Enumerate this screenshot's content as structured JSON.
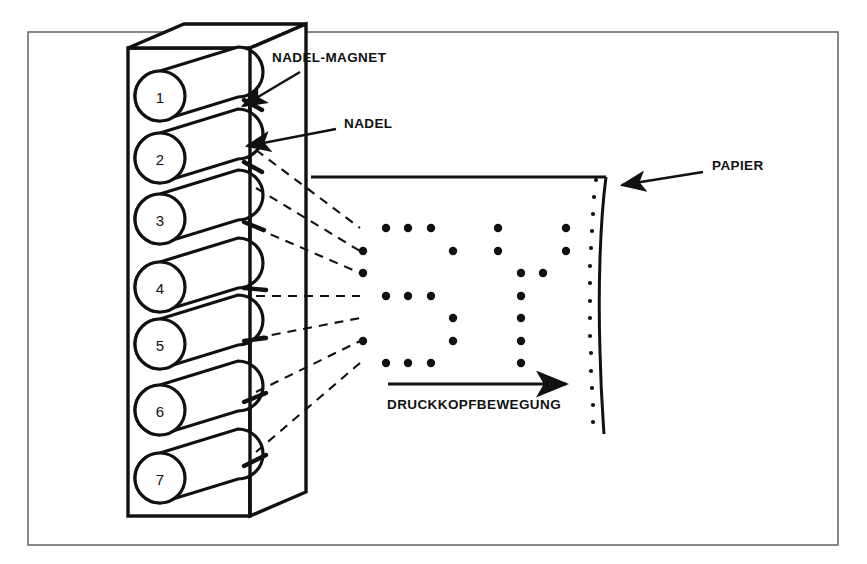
{
  "figure": {
    "background_color": "#ffffff",
    "ink_color": "#111111",
    "frame": {
      "x": 28,
      "y": 32,
      "width": 810,
      "height": 513,
      "stroke_width": 1.6
    }
  },
  "labels": {
    "needle_magnet": "NADEL-MAGNET",
    "needle": "NADEL",
    "paper": "PAPIER",
    "head_movement": "DRUCKKOPFBEWEGUNG"
  },
  "print_head": {
    "needle_count": 7,
    "needle_numbers": [
      "1",
      "2",
      "3",
      "4",
      "5",
      "6",
      "7"
    ],
    "housing": {
      "front_x": 128,
      "front_y": 48,
      "front_w": 122,
      "front_h": 468,
      "depth_x": 56,
      "depth_y": -24
    },
    "needles": [
      {
        "number": "1",
        "cy": 96
      },
      {
        "number": "2",
        "cy": 158
      },
      {
        "number": "3",
        "cy": 219
      },
      {
        "number": "4",
        "cy": 287
      },
      {
        "number": "5",
        "cy": 344
      },
      {
        "number": "6",
        "cy": 410
      },
      {
        "number": "7",
        "cy": 478
      }
    ],
    "coil_radius": 25
  },
  "paper": {
    "top_edge": {
      "x1": 311,
      "y1": 177,
      "x2": 605,
      "y2": 177
    },
    "curved_edge_top": {
      "x": 606,
      "y": 177
    },
    "curved_edge_bottom": {
      "x": 604,
      "y": 434
    },
    "sprocket_dot_count": 15,
    "sprocket_dot_radius": 2.1
  },
  "movement_arrow": {
    "x1": 388,
    "y1": 384,
    "x2": 573,
    "y2": 384,
    "label": "DRUCKKOPFBEWEGUNG"
  },
  "chart_data": {
    "type": "scatter",
    "rows": 7,
    "row_y": [
      228,
      251,
      273,
      296,
      318,
      341,
      363
    ],
    "column_x": [
      363,
      386,
      408,
      431,
      453,
      476,
      498,
      521,
      543,
      566
    ],
    "dot_radius": 4.2,
    "dots": [
      {
        "col": 0,
        "row": 1
      },
      {
        "col": 0,
        "row": 2
      },
      {
        "col": 0,
        "row": 5
      },
      {
        "col": 1,
        "row": 0
      },
      {
        "col": 2,
        "row": 0
      },
      {
        "col": 3,
        "row": 0
      },
      {
        "col": 1,
        "row": 3
      },
      {
        "col": 2,
        "row": 3
      },
      {
        "col": 3,
        "row": 3
      },
      {
        "col": 4,
        "row": 1
      },
      {
        "col": 4,
        "row": 4
      },
      {
        "col": 4,
        "row": 5
      },
      {
        "col": 1,
        "row": 6
      },
      {
        "col": 2,
        "row": 6
      },
      {
        "col": 3,
        "row": 6
      },
      {
        "col": 6,
        "row": 0
      },
      {
        "col": 6,
        "row": 1
      },
      {
        "col": 9,
        "row": 0
      },
      {
        "col": 9,
        "row": 1
      },
      {
        "col": 7,
        "row": 2
      },
      {
        "col": 8,
        "row": 2
      },
      {
        "col": 7,
        "row": 3
      },
      {
        "col": 7,
        "row": 4
      },
      {
        "col": 7,
        "row": 5
      },
      {
        "col": 7,
        "row": 6
      }
    ],
    "xlabel": "",
    "ylabel": ""
  },
  "trajectories": {
    "count": 7,
    "style": "dashed",
    "origin_x": 252,
    "targets": [
      {
        "x": 360,
        "y": 228
      },
      {
        "x": 360,
        "y": 251
      },
      {
        "x": 360,
        "y": 273
      },
      {
        "x": 360,
        "y": 296
      },
      {
        "x": 360,
        "y": 318
      },
      {
        "x": 360,
        "y": 341
      },
      {
        "x": 360,
        "y": 363
      }
    ]
  },
  "annotations": {
    "needle_magnet_leader": {
      "tail_x": 300,
      "tail_y": 72,
      "head_x": 238,
      "head_y": 108
    },
    "needle_leader": {
      "tail_x": 330,
      "tail_y": 130,
      "head_x": 243,
      "head_y": 148
    },
    "paper_leader": {
      "tail_x": 700,
      "tail_y": 173,
      "head_x": 620,
      "head_y": 184
    }
  }
}
